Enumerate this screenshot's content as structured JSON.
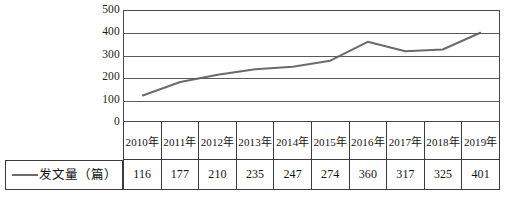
{
  "chart_data": {
    "type": "line",
    "title": "",
    "xlabel": "",
    "ylabel": "",
    "categories": [
      "2010年",
      "2011年",
      "2012年",
      "2013年",
      "2014年",
      "2015年",
      "2016年",
      "2017年",
      "2018年",
      "2019年"
    ],
    "series": [
      {
        "name": "发文量（篇）",
        "values": [
          116,
          177,
          210,
          235,
          247,
          274,
          360,
          317,
          325,
          401
        ],
        "color": "#6b6b6b"
      }
    ],
    "ylim": [
      0,
      500
    ],
    "yticks": [
      500,
      400,
      300,
      200,
      100,
      0
    ],
    "ytick_labels": [
      "500",
      "400",
      "300",
      "200",
      "100",
      "0"
    ],
    "grid": true,
    "legend_position": "table-row-left",
    "legend_label": "发文量（篇）"
  },
  "table": {
    "legend_label": "发文量（篇）",
    "header": [
      "2010年",
      "2011年",
      "2012年",
      "2013年",
      "2014年",
      "2015年",
      "2016年",
      "2017年",
      "2018年",
      "2019年"
    ],
    "values": [
      "116",
      "177",
      "210",
      "235",
      "247",
      "274",
      "360",
      "317",
      "325",
      "401"
    ]
  },
  "colors": {
    "line": "#6b6b6b",
    "grid": "#5a5a5a",
    "border": "#3c3c3c",
    "text": "#141414",
    "background": "#ffffff"
  }
}
